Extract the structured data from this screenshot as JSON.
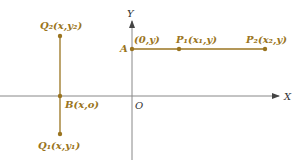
{
  "colors": {
    "accent": "#9a7420",
    "axis": "#777777",
    "axis_text": "#333333"
  },
  "axes": {
    "x_label": "X",
    "y_label": "Y",
    "origin_label": "O"
  },
  "points": {
    "Q2": "Q₂(x,y₂)",
    "Q1": "Q₁(x,y₁)",
    "B": "B(x,o)",
    "A": "A",
    "A_coord": "(0,y)",
    "P1": "P₁(x₁,y)",
    "P2": "P₂(x₂,y)"
  }
}
